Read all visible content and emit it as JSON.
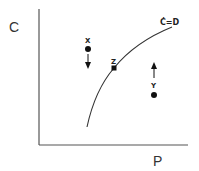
{
  "diagram": {
    "y_axis_label": "C",
    "x_axis_label": "P",
    "curve_label": "Ċ=D",
    "points": [
      {
        "label": "X",
        "arrow": "down"
      },
      {
        "label": "Z",
        "arrow": "none"
      },
      {
        "label": "Y",
        "arrow": "up"
      }
    ],
    "colors": {
      "axis": "#555555",
      "curve": "#333333",
      "points": "#111111"
    }
  }
}
